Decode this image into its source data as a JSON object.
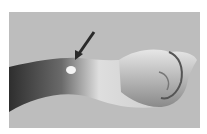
{
  "image": {
    "subject": "forearm and clenched hand with arrow pointing to small lump on wrist",
    "background_color": "#b9b9b9",
    "arrow_color": "#2a2a2a"
  }
}
